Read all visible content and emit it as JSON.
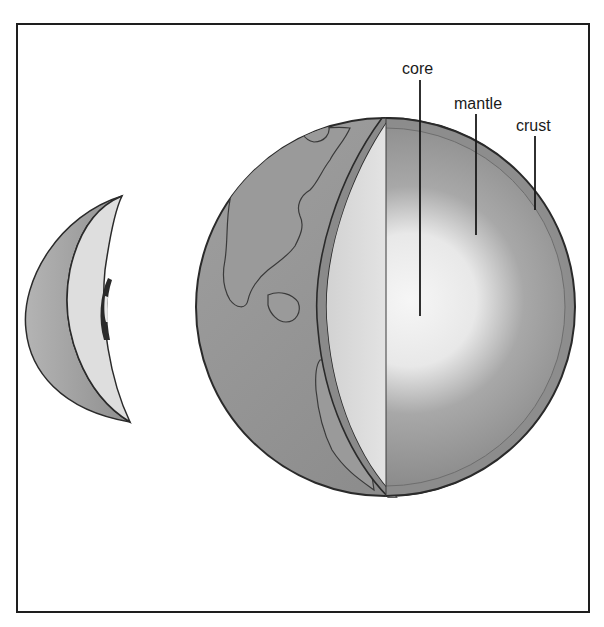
{
  "diagram": {
    "labels": {
      "core": "core",
      "mantle": "mantle",
      "crust": "crust"
    },
    "colors": {
      "frame": "#1e1e1e",
      "ocean": "#8c8c8c",
      "land": "#9e9e9e",
      "crust_band": "#8a8a8a",
      "mantle_outer": "#8f8f8f",
      "mantle_inner": "#c8c8c8",
      "core_center": "#f4f4f4",
      "cut_face_left": "#dcdcdc",
      "outline": "#2a2a2a"
    }
  }
}
